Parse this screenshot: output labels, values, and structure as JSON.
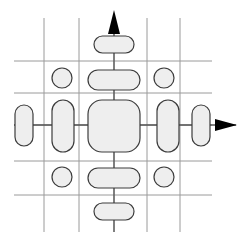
{
  "figure": {
    "width": 243,
    "height": 246,
    "background_color": "#ffffff"
  },
  "colors": {
    "grid_stroke": "#9a9a9a",
    "axis_stroke": "#555555",
    "arrow_fill": "#000000",
    "shape_stroke": "#3c3c3c",
    "shape_fill": "#eeeeee"
  },
  "grid": {
    "stroke_width": 1,
    "vertical_lines": [
      {
        "name": "v1",
        "x": 44,
        "y1": 18,
        "y2": 232
      },
      {
        "name": "v2",
        "x": 79,
        "y1": 18,
        "y2": 232
      },
      {
        "name": "v3",
        "x": 114,
        "y1": 18,
        "y2": 232
      },
      {
        "name": "v4",
        "x": 147,
        "y1": 18,
        "y2": 232
      },
      {
        "name": "v5",
        "x": 180,
        "y1": 18,
        "y2": 232
      }
    ],
    "horizontal_lines": [
      {
        "name": "h1",
        "y": 61,
        "x1": 14,
        "x2": 212
      },
      {
        "name": "h2",
        "y": 93,
        "x1": 14,
        "x2": 212
      },
      {
        "name": "h3",
        "y": 125,
        "x1": 14,
        "x2": 212
      },
      {
        "name": "h4",
        "y": 161,
        "x1": 14,
        "x2": 212
      },
      {
        "name": "h5",
        "y": 195,
        "x1": 14,
        "x2": 212
      }
    ]
  },
  "axes": {
    "stroke_width": 1.3,
    "vertical_axis": {
      "x": 114,
      "y_top": 14,
      "y_bottom": 232
    },
    "horizontal_axis": {
      "y": 125,
      "x_left": 14,
      "x_right": 236
    },
    "arrow_up": {
      "tip_x": 114,
      "tip_y": 10,
      "half_width": 6,
      "length": 24
    },
    "arrow_right": {
      "tip_x": 237,
      "tip_y": 125,
      "half_height": 6,
      "length": 22
    }
  },
  "shapes": [
    {
      "name": "center-rounded-square",
      "type": "rounded-rect",
      "x": 88,
      "y": 100,
      "width": 52,
      "height": 52,
      "rx": 14
    },
    {
      "name": "capsule-up-inner",
      "type": "rounded-rect",
      "x": 88,
      "y": 70,
      "width": 52,
      "height": 20,
      "rx": 10
    },
    {
      "name": "capsule-up-outer",
      "type": "rounded-rect",
      "x": 94,
      "y": 36,
      "width": 40,
      "height": 17,
      "rx": 8.5
    },
    {
      "name": "capsule-down-inner",
      "type": "rounded-rect",
      "x": 88,
      "y": 168,
      "width": 52,
      "height": 20,
      "rx": 10
    },
    {
      "name": "capsule-down-outer",
      "type": "rounded-rect",
      "x": 94,
      "y": 203,
      "width": 40,
      "height": 17,
      "rx": 8.5
    },
    {
      "name": "capsule-left-inner",
      "type": "rounded-rect",
      "x": 52,
      "y": 100,
      "width": 22,
      "height": 52,
      "rx": 11
    },
    {
      "name": "capsule-left-outer",
      "type": "rounded-rect",
      "x": 15,
      "y": 105,
      "width": 18,
      "height": 41,
      "rx": 9
    },
    {
      "name": "capsule-right-inner",
      "type": "rounded-rect",
      "x": 157,
      "y": 100,
      "width": 22,
      "height": 52,
      "rx": 11
    },
    {
      "name": "capsule-right-outer",
      "type": "rounded-rect",
      "x": 192,
      "y": 105,
      "width": 18,
      "height": 41,
      "rx": 9
    },
    {
      "name": "circle-top-left",
      "type": "circle",
      "cx": 62,
      "cy": 78,
      "r": 10
    },
    {
      "name": "circle-top-right",
      "type": "circle",
      "cx": 164,
      "cy": 78,
      "r": 10
    },
    {
      "name": "circle-bottom-left",
      "type": "circle",
      "cx": 62,
      "cy": 177,
      "r": 10
    },
    {
      "name": "circle-bottom-right",
      "type": "circle",
      "cx": 164,
      "cy": 177,
      "r": 10
    }
  ]
}
